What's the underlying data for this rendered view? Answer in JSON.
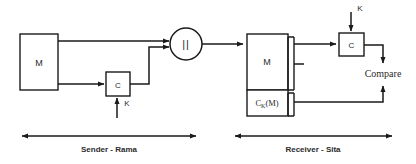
{
  "diagram": {
    "type": "mac-authentication-block-diagram",
    "background_color": "#ffffff",
    "stroke_color": "#1a1a1a",
    "text_color": "#2b2b2b",
    "sender": {
      "section_label": "Sender -  Rama",
      "message_block_label": "M",
      "mac_function_label": "C",
      "key_label": "K",
      "concat_symbol": "||"
    },
    "receiver": {
      "section_label": "Receiver - Sita",
      "message_part_label": "M",
      "mac_part_label_main": "C",
      "mac_part_label_sub": "K",
      "mac_part_label_tail": "(M)",
      "mac_function_label": "C",
      "key_label": "K",
      "compare_label": "Compare"
    }
  }
}
